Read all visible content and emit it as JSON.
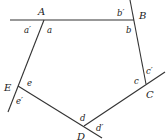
{
  "diagram": {
    "vertices": [
      "A",
      "B",
      "C",
      "D",
      "E"
    ],
    "interior_angles": [
      "a",
      "b",
      "c",
      "d",
      "e"
    ],
    "exterior_angles": [
      "a'",
      "b'",
      "c'",
      "d'",
      "e'"
    ],
    "labels": {
      "A": "A",
      "B": "B",
      "C": "C",
      "D": "D",
      "E": "E",
      "a": "a",
      "b": "b",
      "c": "c",
      "d": "d",
      "e": "e",
      "a_prime": "a′",
      "b_prime": "b′",
      "c_prime": "c′",
      "d_prime": "d′",
      "e_prime": "e′"
    }
  }
}
